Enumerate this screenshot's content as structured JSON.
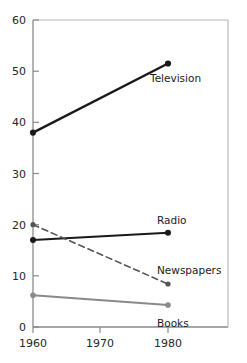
{
  "chart_data": {
    "type": "line",
    "title": "",
    "xlabel": "",
    "ylabel": "",
    "x": [
      1960,
      1980
    ],
    "xlim": [
      1960,
      1980
    ],
    "ylim": [
      0,
      60
    ],
    "grid": false,
    "legend_position": "inline-right-labels",
    "x_ticks": [
      "1960",
      "1970",
      "1980"
    ],
    "x_tick_values": [
      1960,
      1970,
      1980
    ],
    "y_ticks": [
      "0",
      "10",
      "20",
      "30",
      "40",
      "50",
      "60"
    ],
    "y_tick_values": [
      0,
      10,
      20,
      30,
      40,
      50,
      60
    ],
    "series": [
      {
        "name": "Television",
        "label": "Television",
        "values": [
          38.0,
          51.5
        ],
        "color": "#1a1a1a",
        "style": "solid",
        "width": 2.4,
        "markers": true
      },
      {
        "name": "Radio",
        "label": "Radio",
        "values": [
          17.0,
          18.4
        ],
        "color": "#1a1a1a",
        "style": "solid",
        "width": 2.0,
        "markers": true
      },
      {
        "name": "Newspapers",
        "label": "Newspapers",
        "values": [
          20.0,
          8.4
        ],
        "color": "#555555",
        "style": "dashed",
        "width": 1.6,
        "markers": true
      },
      {
        "name": "Books",
        "label": "Books",
        "values": [
          6.2,
          4.3
        ],
        "color": "#8a8a8a",
        "style": "solid",
        "width": 2.2,
        "markers": true
      }
    ],
    "annotations": [
      {
        "text": "Television",
        "x": 150,
        "y": 82
      },
      {
        "text": "Radio",
        "x": 157,
        "y": 224
      },
      {
        "text": "Newspapers",
        "x": 157,
        "y": 274
      },
      {
        "text": "Books",
        "x": 157,
        "y": 327
      }
    ],
    "axis_color": "#8a8a8a"
  },
  "axis": {
    "y_label_60": "60",
    "y_label_50": "50",
    "y_label_40": "40",
    "y_label_30": "30",
    "y_label_20": "20",
    "y_label_10": "10",
    "y_label_0": "0",
    "x_label_1960": "1960",
    "x_label_1970": "1970",
    "x_label_1980": "1980"
  },
  "labels": {
    "television": "Television",
    "radio": "Radio",
    "newspapers": "Newspapers",
    "books": "Books"
  }
}
